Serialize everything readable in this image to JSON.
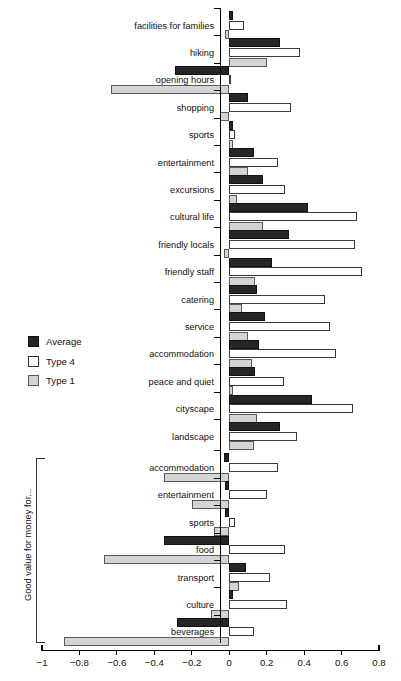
{
  "chart_data": {
    "type": "bar",
    "orientation": "horizontal",
    "title": "",
    "xlabel": "",
    "ylabel": "",
    "xlim": [
      -1,
      0.8
    ],
    "xticks": [
      -1,
      -0.8,
      -0.6,
      -0.4,
      -0.2,
      0,
      0.2,
      0.4,
      0.6,
      0.8
    ],
    "xticklabels": [
      "−1",
      "−0.8",
      "−0.6",
      "−0.4",
      "−0.2",
      "0",
      "0.2",
      "0.4",
      "0.6",
      "0.8"
    ],
    "grid": false,
    "legend_position": "left-middle",
    "series": [
      {
        "name": "Average",
        "color": "#262626"
      },
      {
        "name": "Type 4",
        "color": "#ffffff"
      },
      {
        "name": "Type 1",
        "color": "#d4d4d4"
      }
    ],
    "groups": [
      {
        "label": "",
        "categories": [
          "facilities for families",
          "hiking",
          "opening hours",
          "shopping",
          "sports",
          "entertainment",
          "excursions",
          "cultural life",
          "friendly locals",
          "friendly staff",
          "catering",
          "service",
          "accommodation",
          "peace and quiet",
          "cityscape",
          "landscape"
        ],
        "values": {
          "Average": [
            0.02,
            0.27,
            -0.29,
            0.1,
            0.02,
            0.13,
            0.18,
            0.42,
            0.32,
            0.23,
            0.15,
            0.19,
            0.16,
            0.14,
            0.44,
            0.27
          ],
          "Type 4": [
            0.08,
            0.38,
            0.0,
            0.33,
            0.03,
            0.26,
            0.3,
            0.68,
            0.67,
            0.71,
            0.51,
            0.54,
            0.57,
            0.29,
            0.66,
            0.36
          ],
          "Type 1": [
            -0.02,
            0.2,
            -0.63,
            -0.05,
            0.02,
            0.1,
            0.04,
            0.18,
            -0.03,
            0.14,
            0.07,
            0.1,
            0.12,
            0.02,
            0.15,
            0.13
          ]
        }
      },
      {
        "label": "Good value for money for...",
        "categories": [
          "accommodation",
          "entertainment",
          "sports",
          "food",
          "transport",
          "culture",
          "beverages"
        ],
        "values": {
          "Average": [
            -0.03,
            -0.02,
            -0.02,
            -0.35,
            0.09,
            0.02,
            -0.28
          ],
          "Type 4": [
            0.26,
            0.2,
            0.03,
            0.3,
            0.22,
            0.31,
            0.13
          ],
          "Type 1": [
            -0.35,
            -0.2,
            -0.08,
            -0.67,
            0.05,
            -0.1,
            -0.88
          ]
        }
      }
    ]
  }
}
